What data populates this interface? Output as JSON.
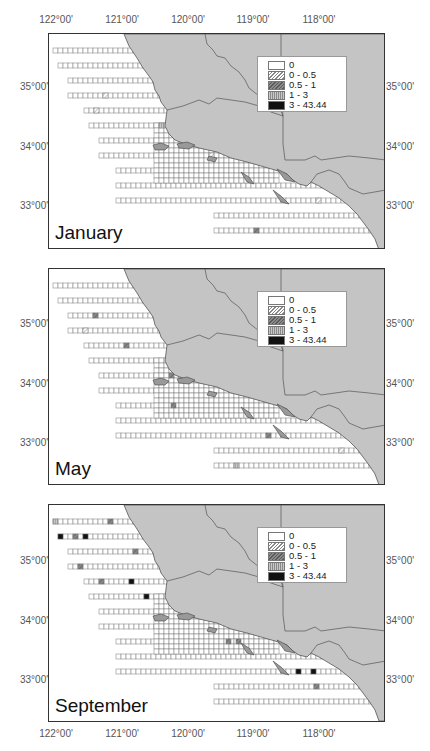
{
  "figure": {
    "longitude_labels": [
      "122°00'",
      "121°00'",
      "120°00'",
      "119°00'",
      "118°00'"
    ],
    "latitude_labels": [
      "35°00'",
      "34°00'",
      "33°00'"
    ],
    "legend": {
      "entries": [
        {
          "label": "0",
          "class": "0"
        },
        {
          "label": "0 - 0.5",
          "class": "1"
        },
        {
          "label": "0.5 - 1",
          "class": "2"
        },
        {
          "label": "1 - 3",
          "class": "3"
        },
        {
          "label": "3 - 43.44",
          "class": "4"
        }
      ]
    },
    "colors": {
      "land": "#c4c4c4",
      "border": "#333333",
      "cell_outline": "#777777",
      "class_2": "#6e6e6e",
      "class_4": "#111111"
    },
    "panels": [
      {
        "month": "January"
      },
      {
        "month": "May"
      },
      {
        "month": "September"
      }
    ]
  }
}
